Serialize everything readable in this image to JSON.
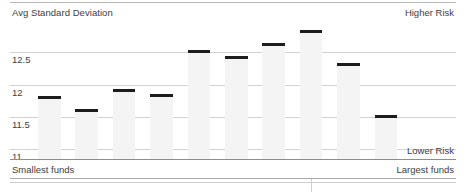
{
  "header": {
    "axis_title": "Avg Standard Deviation",
    "risk_high_label": "Higher Risk",
    "risk_low_label": "Lower Risk"
  },
  "footer": {
    "category_left": "Smallest funds",
    "category_right": "Largest funds"
  },
  "colors": {
    "marker": "#1c1c1c",
    "bar_fill": "#f4f4f4",
    "gridline": "#d3d3d3",
    "axis_line": "#8d8d8d",
    "text": "#3d3d3d"
  },
  "chart_data": {
    "type": "bar",
    "title": "Avg Standard Deviation",
    "xlabel": "",
    "ylabel": "Avg Standard Deviation",
    "grid": true,
    "legend": "none",
    "ylim": [
      10.85,
      13.0
    ],
    "yticks": [
      12.5,
      12,
      11.5,
      11
    ],
    "ytick_labels": [
      "12.5",
      "12",
      "11.5",
      "11"
    ],
    "axis_annotations": {
      "y_top": "Higher Risk",
      "y_bottom": "Lower Risk",
      "x_start": "Smallest funds",
      "x_end": "Largest funds"
    },
    "categories": [
      "1",
      "2",
      "3",
      "4",
      "5",
      "6",
      "7",
      "8",
      "9",
      "10"
    ],
    "values": [
      11.82,
      11.63,
      11.93,
      11.85,
      12.54,
      12.45,
      12.65,
      12.84,
      12.34,
      11.53
    ]
  }
}
